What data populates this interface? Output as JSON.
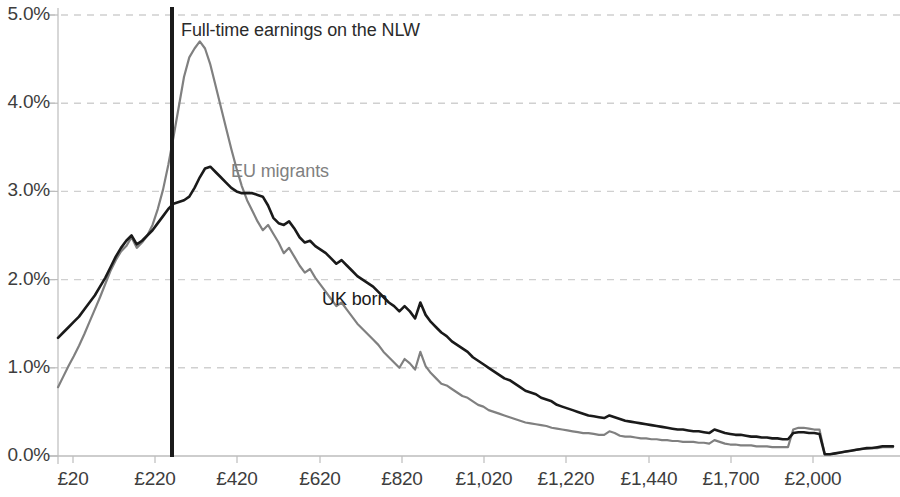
{
  "chart_data": {
    "type": "line",
    "title": "",
    "subtitle": "",
    "xlabel": "",
    "ylabel": "",
    "grid": true,
    "legend_position": "inline-annotation",
    "xlim": [
      20,
      2100
    ],
    "ylim": [
      0.0,
      5.0
    ],
    "y_tick_labels": [
      "0.0%",
      "1.0%",
      "2.0%",
      "3.0%",
      "4.0%",
      "5.0%"
    ],
    "y_tick_values": [
      0.0,
      1.0,
      2.0,
      3.0,
      4.0,
      5.0
    ],
    "x_tick_labels": [
      "£20",
      "£220",
      "£420",
      "£620",
      "£820",
      "£1,020",
      "£1,220",
      "£1,440",
      "£1,700",
      "£2,000"
    ],
    "x_tick_values": [
      20,
      220,
      420,
      620,
      820,
      1020,
      1220,
      1440,
      1700,
      2000
    ],
    "annotations": [
      {
        "name": "nlw-line",
        "text": "Full-time earnings on the NLW",
        "x_value": 272,
        "type": "vertical-line",
        "color": "#1a1a1a"
      }
    ],
    "series": [
      {
        "name": "EU migrants",
        "color": "#808080",
        "label_x": 620,
        "label_y": 3.35,
        "values": [
          0.78,
          0.9,
          1.02,
          1.13,
          1.25,
          1.38,
          1.52,
          1.66,
          1.8,
          1.95,
          2.1,
          2.22,
          2.32,
          2.38,
          2.48,
          2.36,
          2.42,
          2.5,
          2.62,
          2.8,
          3.02,
          3.3,
          3.62,
          3.96,
          4.3,
          4.52,
          4.62,
          4.7,
          4.62,
          4.44,
          4.2,
          3.96,
          3.72,
          3.48,
          3.26,
          3.06,
          2.9,
          2.78,
          2.66,
          2.56,
          2.62,
          2.52,
          2.42,
          2.3,
          2.36,
          2.26,
          2.16,
          2.08,
          2.12,
          2.02,
          1.94,
          1.86,
          1.78,
          1.7,
          1.74,
          1.66,
          1.58,
          1.5,
          1.44,
          1.38,
          1.32,
          1.26,
          1.18,
          1.12,
          1.06,
          1.0,
          1.1,
          1.05,
          0.98,
          1.18,
          1.02,
          0.94,
          0.88,
          0.82,
          0.8,
          0.76,
          0.72,
          0.68,
          0.66,
          0.62,
          0.58,
          0.56,
          0.52,
          0.5,
          0.48,
          0.46,
          0.44,
          0.42,
          0.4,
          0.38,
          0.37,
          0.36,
          0.35,
          0.34,
          0.32,
          0.31,
          0.3,
          0.29,
          0.28,
          0.27,
          0.26,
          0.26,
          0.25,
          0.24,
          0.24,
          0.28,
          0.26,
          0.23,
          0.22,
          0.22,
          0.21,
          0.2,
          0.2,
          0.19,
          0.19,
          0.18,
          0.18,
          0.17,
          0.17,
          0.16,
          0.16,
          0.16,
          0.15,
          0.15,
          0.14,
          0.18,
          0.16,
          0.14,
          0.13,
          0.13,
          0.12,
          0.12,
          0.12,
          0.11,
          0.11,
          0.11,
          0.1,
          0.1,
          0.1,
          0.1,
          0.3,
          0.32,
          0.32,
          0.31,
          0.3,
          0.3,
          0.02,
          0.02,
          0.03,
          0.04,
          0.05,
          0.06,
          0.07,
          0.08,
          0.08,
          0.09,
          0.09,
          0.1,
          0.1,
          0.1
        ]
      },
      {
        "name": "UK born",
        "color": "#1a1a1a",
        "label_x": 700,
        "label_y": 1.78,
        "values": [
          1.34,
          1.4,
          1.46,
          1.52,
          1.58,
          1.66,
          1.74,
          1.82,
          1.92,
          2.02,
          2.14,
          2.26,
          2.36,
          2.44,
          2.5,
          2.4,
          2.44,
          2.5,
          2.56,
          2.64,
          2.72,
          2.8,
          2.86,
          2.88,
          2.9,
          2.94,
          3.04,
          3.16,
          3.26,
          3.28,
          3.22,
          3.16,
          3.1,
          3.04,
          3.0,
          2.98,
          2.98,
          2.98,
          2.96,
          2.94,
          2.84,
          2.7,
          2.64,
          2.62,
          2.66,
          2.58,
          2.48,
          2.42,
          2.44,
          2.38,
          2.34,
          2.3,
          2.24,
          2.18,
          2.22,
          2.16,
          2.1,
          2.04,
          2.0,
          1.96,
          1.92,
          1.86,
          1.8,
          1.74,
          1.7,
          1.64,
          1.7,
          1.64,
          1.56,
          1.74,
          1.6,
          1.52,
          1.46,
          1.4,
          1.36,
          1.3,
          1.26,
          1.22,
          1.18,
          1.12,
          1.08,
          1.04,
          1.0,
          0.96,
          0.92,
          0.88,
          0.86,
          0.82,
          0.78,
          0.74,
          0.72,
          0.7,
          0.66,
          0.64,
          0.62,
          0.58,
          0.56,
          0.54,
          0.52,
          0.5,
          0.48,
          0.46,
          0.45,
          0.44,
          0.43,
          0.46,
          0.44,
          0.42,
          0.4,
          0.39,
          0.38,
          0.37,
          0.36,
          0.35,
          0.34,
          0.33,
          0.32,
          0.31,
          0.3,
          0.3,
          0.29,
          0.28,
          0.28,
          0.27,
          0.26,
          0.3,
          0.28,
          0.26,
          0.25,
          0.24,
          0.24,
          0.23,
          0.22,
          0.22,
          0.21,
          0.21,
          0.2,
          0.2,
          0.19,
          0.19,
          0.26,
          0.27,
          0.27,
          0.26,
          0.26,
          0.25,
          0.02,
          0.02,
          0.03,
          0.04,
          0.05,
          0.06,
          0.07,
          0.08,
          0.09,
          0.09,
          0.1,
          0.11,
          0.11,
          0.11
        ]
      }
    ]
  },
  "colors": {
    "eu_migrants": "#808080",
    "uk_born": "#1a1a1a",
    "gridline": "#d0d0d0",
    "axis": "#bdbdbd",
    "tick_text": "#3d3d3d",
    "background": "#ffffff"
  },
  "labels": {
    "eu_migrants": "EU migrants",
    "uk_born": "UK born",
    "nlw_annotation": "Full-time earnings on the NLW"
  }
}
